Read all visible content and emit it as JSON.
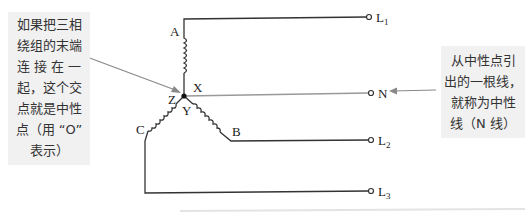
{
  "diagram": {
    "type": "three-phase star (Y) connection",
    "nodes": {
      "center": {
        "x": 184,
        "y": 96
      },
      "winding_labels": [
        "A",
        "B",
        "C",
        "X",
        "Y",
        "Z"
      ]
    },
    "terminals": [
      {
        "id": "L1",
        "label": "L",
        "sub": "1"
      },
      {
        "id": "N",
        "label": "N",
        "sub": ""
      },
      {
        "id": "L2",
        "label": "L",
        "sub": "2"
      },
      {
        "id": "L3",
        "label": "L",
        "sub": "3"
      }
    ],
    "left_callout": {
      "lines": [
        "如果把三相",
        "绕组的末端",
        "连 接 在 一",
        "起，这个交",
        "点就是中性",
        "点（用 “O”",
        "表示）"
      ]
    },
    "right_callout": {
      "lines": [
        "从中性点引",
        "出的一根线，",
        "就称为中性",
        "线（N 线）"
      ]
    },
    "colors": {
      "wire": "#333333",
      "neutral_wire": "#999999",
      "arrow": "#888888",
      "callout_bg": "#f1f1f1"
    }
  }
}
